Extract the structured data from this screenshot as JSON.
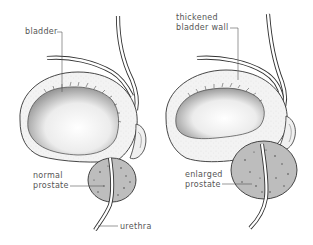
{
  "diagram": {
    "left_panel": {
      "name": "normal",
      "labels": {
        "bladder": "bladder",
        "prostate_line1": "normal",
        "prostate_line2": "prostate",
        "urethra": "urethra"
      }
    },
    "right_panel": {
      "name": "enlarged",
      "labels": {
        "wall_line1": "thickened",
        "wall_line2": "bladder wall",
        "prostate_line1": "enlarged",
        "prostate_line2": "prostate"
      }
    },
    "colors": {
      "outline": "#333333",
      "wall_fill": "#f4f4f4",
      "lumen_fill": "#e6e6e6",
      "prostate_fill": "#b8b8b8",
      "label_text": "#555555"
    }
  }
}
